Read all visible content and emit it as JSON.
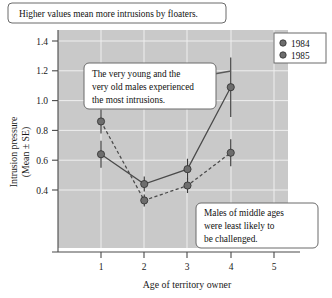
{
  "chart_data": {
    "type": "line",
    "title": "",
    "xlabel": "Age of territory owner",
    "ylabel": "Intrusion pressure (Mean ± SE)",
    "ylabel_line1": "Intrusion pressure",
    "ylabel_line2": "(Mean ± SE)",
    "x": [
      1,
      2,
      3,
      4
    ],
    "xlim": [
      0.5,
      5.5
    ],
    "ylim": [
      0.3,
      1.45
    ],
    "xticks": [
      "1",
      "2",
      "3",
      "4",
      "5"
    ],
    "xtick_values": [
      1,
      2,
      3,
      4,
      5
    ],
    "yticks": [
      "0.4",
      "0.6",
      "0.8",
      "1.0",
      "1.2",
      "1.4"
    ],
    "ytick_values": [
      0.4,
      0.6,
      0.8,
      1.0,
      1.2,
      1.4
    ],
    "grid": true,
    "legend_position": "top-right",
    "series": [
      {
        "name": "1984",
        "linestyle": "solid",
        "values": [
          0.64,
          0.44,
          0.54,
          1.09
        ],
        "errors": [
          0.09,
          0.05,
          0.07,
          0.2
        ]
      },
      {
        "name": "1985",
        "linestyle": "dashed",
        "values": [
          0.86,
          0.33,
          0.43,
          0.65
        ],
        "errors": [
          0.08,
          0.04,
          0.05,
          0.09
        ]
      }
    ],
    "annotations": [
      {
        "id": "annotation-floaters",
        "lines": [
          "Higher values mean more intrusions by floaters."
        ]
      },
      {
        "id": "annotation-young-old",
        "lines": [
          "The very young and the",
          "very old males experienced",
          "the most intrusions."
        ]
      },
      {
        "id": "annotation-middle-ages",
        "lines": [
          "Males of middle ages",
          "were least likely to",
          "be challenged."
        ]
      }
    ],
    "colors": {
      "plot_background": "#c9c9c9",
      "gridline": "#efefef",
      "marker": "#6d6d6d",
      "line": "#4a4a4a",
      "callout_background": "#ffffff",
      "callout_border": "#6a6a6a"
    }
  }
}
